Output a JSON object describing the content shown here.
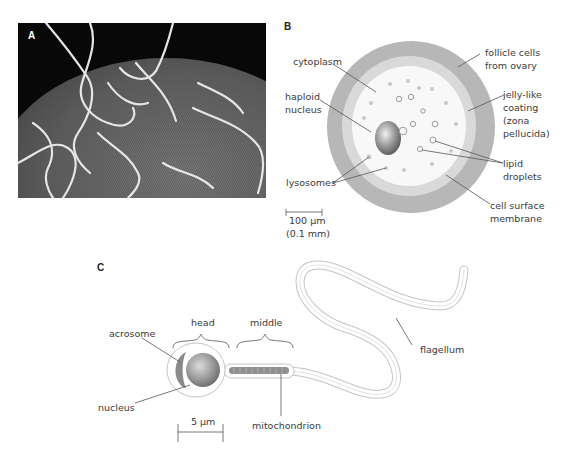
{
  "panels": {
    "a": {
      "letter": "A",
      "description": "scanning electron micrograph of sperm cells on egg surface"
    },
    "b": {
      "letter": "B",
      "labels": {
        "cytoplasm": "cytoplasm",
        "haploid_nucleus_1": "haploid",
        "haploid_nucleus_2": "nucleus",
        "lysosomes": "lysosomes",
        "follicle_1": "follicle cells",
        "follicle_2": "from ovary",
        "jelly_1": "jelly-like",
        "jelly_2": "coating",
        "jelly_3": "(zona",
        "jelly_4": "pellucida)",
        "lipid_1": "lipid",
        "lipid_2": "droplets",
        "membrane_1": "cell surface",
        "membrane_2": "membrane"
      },
      "scale": {
        "value": "100 μm",
        "alt": "(0.1 mm)"
      },
      "colors": {
        "follicle": "#b4b4b4",
        "jelly": "#d6d6d6",
        "cytoplasm": "#f7f7f7"
      }
    },
    "c": {
      "letter": "C",
      "labels": {
        "head": "head",
        "middle": "middle",
        "acrosome": "acrosome",
        "nucleus": "nucleus",
        "mitochondrion": "mitochondrion",
        "flagellum": "flagellum"
      },
      "scale": {
        "value": "5 μm"
      }
    }
  }
}
